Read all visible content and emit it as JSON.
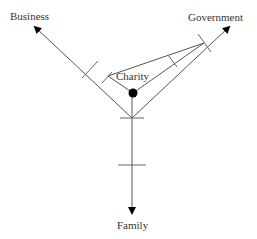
{
  "diagram": {
    "labels": {
      "business": "Business",
      "government": "Government",
      "charity": "Charity",
      "family": "Family"
    },
    "colors": {
      "line": "#555555",
      "tick": "#666666",
      "dot": "#000000",
      "text": "#333333"
    }
  }
}
